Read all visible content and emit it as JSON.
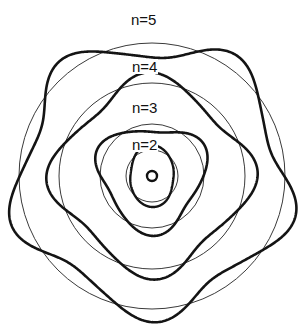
{
  "figure": {
    "background_color": "#ffffff",
    "width": 307,
    "height": 336,
    "center": {
      "x": 152,
      "y": 176
    },
    "nucleus": {
      "name": "nucleus",
      "symbol": "o",
      "radius": 5,
      "stroke_color": "#111111"
    }
  },
  "chart_data": {
    "type": "line",
    "xlabel": "",
    "ylabel": "",
    "grid": false,
    "legend_position": "inline-labels",
    "center": {
      "x": 152,
      "y": 176
    },
    "series": [
      {
        "name": "n=2",
        "label": "n=2",
        "quantum_number": 2,
        "lobes": 2,
        "circle_radius": 26,
        "wave_mean_radius": 26,
        "wave_amplitude": 5,
        "phase_deg": 90,
        "thin_stroke": "#3a3a3a",
        "thick_stroke": "#141414"
      },
      {
        "name": "n=3",
        "label": "n=3",
        "quantum_number": 3,
        "lobes": 3,
        "circle_radius": 52,
        "wave_mean_radius": 52,
        "wave_amplitude": 8,
        "phase_deg": 90,
        "thin_stroke": "#3a3a3a",
        "thick_stroke": "#141414"
      },
      {
        "name": "n=4",
        "label": "n=4",
        "quantum_number": 4,
        "lobes": 4,
        "circle_radius": 93,
        "wave_mean_radius": 93,
        "wave_amplitude": 11,
        "phase_deg": 90,
        "thin_stroke": "#3a3a3a",
        "thick_stroke": "#141414"
      },
      {
        "name": "n=5",
        "label": "n=5",
        "quantum_number": 5,
        "lobes": 5,
        "circle_radius": 133,
        "wave_mean_radius": 133,
        "wave_amplitude": 14,
        "phase_deg": 90,
        "thin_stroke": "#3a3a3a",
        "thick_stroke": "#141414"
      }
    ]
  },
  "labels": {
    "n5": "n=5",
    "n4": "n=4",
    "n3": "n=3",
    "n2": "n=2"
  }
}
